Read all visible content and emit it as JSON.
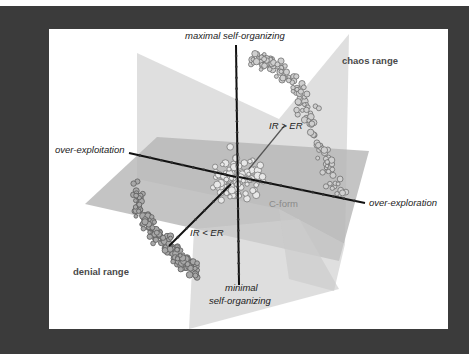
{
  "figure": {
    "colors": {
      "frame": "#3b3b3b",
      "panel": "#ffffff",
      "plane_light": "#d9d9d9",
      "plane_mid": "#c4c4c4",
      "plane_dark": "#a9a9a9",
      "axis": "#111111",
      "point_edge": "#6f6f6f",
      "point_fill": "#bdbdbd"
    },
    "labels": {
      "axis_top": "maximal self-organizing",
      "axis_bottom_line1": "minimal",
      "axis_bottom_line2": "self-organizing",
      "axis_left": "over-exploitation",
      "axis_right": "over-exploration",
      "diag_upper": "IR > ER",
      "diag_lower": "IR < ER",
      "cluster_upper": "chaos range",
      "cluster_lower": "denial range",
      "cluster_center": "C-form"
    }
  },
  "chart_data": {
    "type": "scatter",
    "title": "",
    "dimensions": 3,
    "axes": [
      {
        "name": "vertical",
        "positive": "maximal self-organizing",
        "negative": "minimal self-organizing"
      },
      {
        "name": "horizontal",
        "positive": "over-exploration",
        "negative": "over-exploitation"
      },
      {
        "name": "depth",
        "positive": "IR > ER",
        "negative": "IR < ER"
      }
    ],
    "grid": false,
    "planes": [
      "horizontal plane",
      "vertical plane"
    ],
    "clusters": [
      {
        "name": "chaos range",
        "region": "upper right (IR > ER, over-exploration, maximal self-organizing)",
        "approx_points": 350
      },
      {
        "name": "C-form",
        "region": "center (origin)",
        "approx_points": 200
      },
      {
        "name": "denial range",
        "region": "lower left (IR < ER, over-exploitation, minimal self-organizing)",
        "approx_points": 400
      }
    ],
    "annotations": [
      "chaos range",
      "denial range",
      "C-form",
      "IR > ER",
      "IR < ER"
    ],
    "legend": null
  }
}
